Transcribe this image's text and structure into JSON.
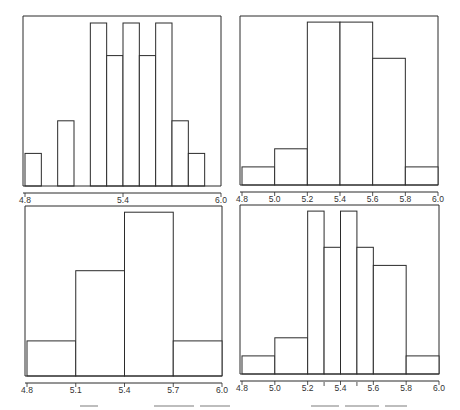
{
  "chart_data": [
    {
      "id": "top-left",
      "type": "bar",
      "subtype": "histogram",
      "title": "",
      "xlabel": "",
      "ylabel": "",
      "xlim": [
        4.8,
        6.0
      ],
      "bin_width": 0.1,
      "bin_edges": [
        4.8,
        4.9,
        5.0,
        5.1,
        5.2,
        5.3,
        5.4,
        5.5,
        5.6,
        5.7,
        5.8,
        5.9,
        6.0
      ],
      "values": [
        1,
        0,
        2,
        0,
        5,
        4,
        5,
        4,
        5,
        2,
        1,
        0
      ],
      "x_tick_labels": [
        "4.8",
        "5.4",
        "6.0"
      ],
      "x_ticks": [
        4.8,
        5.4,
        6.0
      ],
      "grid": false,
      "legend": null
    },
    {
      "id": "top-right",
      "type": "bar",
      "subtype": "histogram",
      "title": "",
      "xlabel": "",
      "ylabel": "",
      "xlim": [
        4.8,
        6.0
      ],
      "bin_width": 0.2,
      "bin_edges": [
        4.8,
        5.0,
        5.2,
        5.4,
        5.6,
        5.8,
        6.0
      ],
      "values": [
        1,
        2,
        9,
        9,
        7,
        1
      ],
      "x_tick_labels": [
        "4.8",
        "5.0",
        "5.2",
        "5.4",
        "5.6",
        "5.8",
        "6.0"
      ],
      "x_ticks": [
        4.8,
        5.0,
        5.2,
        5.4,
        5.6,
        5.8,
        6.0
      ],
      "grid": false,
      "legend": null
    },
    {
      "id": "bottom-left",
      "type": "bar",
      "subtype": "histogram",
      "title": "",
      "xlabel": "",
      "ylabel": "",
      "xlim": [
        4.8,
        6.0
      ],
      "bin_width": 0.3,
      "bin_edges": [
        4.8,
        5.1,
        5.4,
        5.7,
        6.0
      ],
      "values": [
        3,
        9,
        14,
        3
      ],
      "x_tick_labels": [
        "4.8",
        "5.1",
        "5.4",
        "5.7",
        "6.0"
      ],
      "x_ticks": [
        4.8,
        5.1,
        5.4,
        5.7,
        6.0
      ],
      "grid": false,
      "legend": null
    },
    {
      "id": "bottom-right",
      "type": "bar",
      "subtype": "histogram (unequal bin widths)",
      "title": "",
      "xlabel": "",
      "ylabel": "",
      "xlim": [
        4.8,
        6.0
      ],
      "bin_edges": [
        4.8,
        5.0,
        5.2,
        5.3,
        5.4,
        5.5,
        5.6,
        5.8,
        6.0
      ],
      "values": [
        1,
        2,
        9,
        7,
        9,
        7,
        6,
        1
      ],
      "x_tick_labels": [
        "4.8",
        "5.0",
        "5.2",
        "5.4",
        "5.6",
        "5.8",
        "6.0"
      ],
      "x_ticks": [
        4.8,
        5.0,
        5.2,
        5.4,
        5.6,
        5.8,
        6.0
      ],
      "minor_ticks": [
        5.3,
        5.5
      ],
      "grid": false,
      "legend": null
    }
  ],
  "panels": {
    "top_left": {
      "ticks": [
        {
          "label": "4.8",
          "v": 4.8
        },
        {
          "label": "5.4",
          "v": 5.4
        },
        {
          "label": "6.0",
          "v": 6.0
        }
      ]
    },
    "top_right": {
      "ticks": [
        {
          "label": "4.8",
          "v": 4.8
        },
        {
          "label": "5.0",
          "v": 5.0
        },
        {
          "label": "5.2",
          "v": 5.2
        },
        {
          "label": "5.4",
          "v": 5.4
        },
        {
          "label": "5.6",
          "v": 5.6
        },
        {
          "label": "5.8",
          "v": 5.8
        },
        {
          "label": "6.0",
          "v": 6.0
        }
      ]
    },
    "bottom_left": {
      "ticks": [
        {
          "label": "4.8",
          "v": 4.8
        },
        {
          "label": "5.1",
          "v": 5.1
        },
        {
          "label": "5.4",
          "v": 5.4
        },
        {
          "label": "5.7",
          "v": 5.7
        },
        {
          "label": "6.0",
          "v": 6.0
        }
      ]
    },
    "bottom_right": {
      "ticks": [
        {
          "label": "4.8",
          "v": 4.8
        },
        {
          "label": "5.0",
          "v": 5.0
        },
        {
          "label": "5.2",
          "v": 5.2
        },
        {
          "label": "5.4",
          "v": 5.4
        },
        {
          "label": "5.6",
          "v": 5.6
        },
        {
          "label": "5.8",
          "v": 5.8
        },
        {
          "label": "6.0",
          "v": 6.0
        }
      ]
    }
  },
  "colors": {
    "stroke": "#2b2b2b",
    "fill": "#ffffff",
    "text": "#333333",
    "caption_sliver": "#bdbdbd"
  }
}
